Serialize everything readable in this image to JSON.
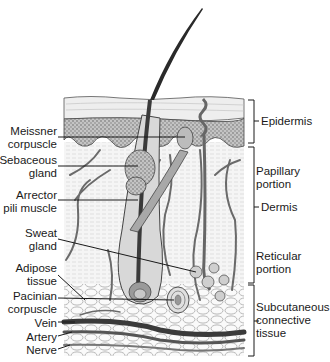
{
  "figure": {
    "left_labels": [
      {
        "id": "meissner",
        "line1": "Meissner",
        "line2": "corpuscle"
      },
      {
        "id": "sebaceous",
        "line1": "Sebaceous",
        "line2": "gland"
      },
      {
        "id": "arrector",
        "line1": "Arrector",
        "line2": "pili muscle"
      },
      {
        "id": "sweat",
        "line1": "Sweat",
        "line2": "gland"
      },
      {
        "id": "adipose",
        "line1": "Adipose",
        "line2": "tissue"
      },
      {
        "id": "pacinian",
        "line1": "Pacinian",
        "line2": "corpuscle"
      },
      {
        "id": "vein",
        "line1": "Vein"
      },
      {
        "id": "artery",
        "line1": "Artery"
      },
      {
        "id": "nerve",
        "line1": "Nerve"
      }
    ],
    "right_labels": {
      "epidermis": "Epidermis",
      "papillary": {
        "line1": "Papillary",
        "line2": "portion"
      },
      "dermis": "Dermis",
      "reticular": {
        "line1": "Reticular",
        "line2": "portion"
      },
      "subcutaneous": {
        "line1": "Subcutaneous",
        "line2": "connective",
        "line3": "tissue"
      }
    },
    "colors": {
      "ink": "#1a1a1a",
      "epidermis_fill": "#b9b9b9",
      "stratum_corneum": "#ededed",
      "dermis_fill": "#f4f4f4",
      "vessel": "#6e6e6e",
      "hair": "#2a2a2a"
    }
  }
}
